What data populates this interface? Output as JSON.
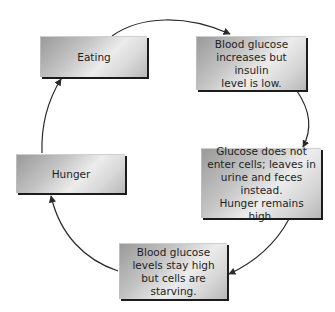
{
  "diagram": {
    "type": "cycle",
    "direction": "clockwise",
    "nodes": [
      {
        "id": "eating",
        "label": "Eating"
      },
      {
        "id": "increase",
        "label": "Blood glucose\nincreases but insulin\nlevel is low."
      },
      {
        "id": "glucose",
        "label": "Glucose does not\nenter cells; leaves in\nurine and feces instead.\nHunger remains high."
      },
      {
        "id": "starving",
        "label": "Blood glucose\nlevels stay high\nbut cells are starving."
      },
      {
        "id": "hunger",
        "label": "Hunger"
      }
    ],
    "edges": [
      {
        "from": "eating",
        "to": "increase"
      },
      {
        "from": "increase",
        "to": "glucose"
      },
      {
        "from": "glucose",
        "to": "starving"
      },
      {
        "from": "starving",
        "to": "hunger"
      },
      {
        "from": "hunger",
        "to": "eating"
      }
    ],
    "colors": {
      "arrow": "#2a2a2a",
      "box_light": "#ececec",
      "box_dark": "#9a9a9a",
      "box_shadow": "#1c1c1c",
      "text": "#1e1e1e"
    }
  }
}
